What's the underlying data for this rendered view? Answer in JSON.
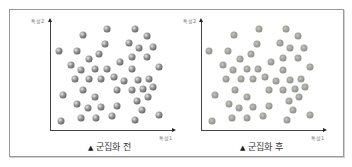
{
  "figure": {
    "panels": [
      {
        "id": "before",
        "caption_marker": "▲",
        "caption": "군집화 전",
        "y_label": "특성2",
        "x_label": "특성1",
        "dot_color": "#6e6e6e"
      },
      {
        "id": "after",
        "caption_marker": "▲",
        "caption": "군집화 후",
        "y_label": "특성2",
        "x_label": "특성1",
        "dot_color": "#9ea09a"
      }
    ],
    "points_before": [
      [
        83,
        35
      ],
      [
        107,
        29
      ],
      [
        135,
        29
      ],
      [
        147,
        36
      ],
      [
        59,
        51
      ],
      [
        77,
        51
      ],
      [
        105,
        44
      ],
      [
        129,
        43
      ],
      [
        139,
        48
      ],
      [
        153,
        47
      ],
      [
        89,
        59
      ],
      [
        99,
        54
      ],
      [
        120,
        62
      ],
      [
        132,
        57
      ],
      [
        147,
        57
      ],
      [
        71,
        65
      ],
      [
        81,
        70
      ],
      [
        95,
        69
      ],
      [
        107,
        69
      ],
      [
        132,
        69
      ],
      [
        159,
        67
      ],
      [
        75,
        79
      ],
      [
        89,
        79
      ],
      [
        101,
        79
      ],
      [
        114,
        77
      ],
      [
        124,
        81
      ],
      [
        138,
        80
      ],
      [
        149,
        79
      ],
      [
        63,
        95
      ],
      [
        83,
        90
      ],
      [
        117,
        90
      ],
      [
        132,
        90
      ],
      [
        143,
        89
      ],
      [
        153,
        87
      ],
      [
        95,
        97
      ],
      [
        137,
        101
      ],
      [
        148,
        97
      ],
      [
        77,
        104
      ],
      [
        88,
        108
      ],
      [
        101,
        107
      ],
      [
        117,
        106
      ],
      [
        142,
        110
      ],
      [
        61,
        121
      ],
      [
        81,
        118
      ],
      [
        96,
        118
      ],
      [
        112,
        116
      ],
      [
        135,
        120
      ],
      [
        159,
        115
      ]
    ],
    "points_after": [
      [
        234,
        35
      ],
      [
        259,
        29
      ],
      [
        286,
        29
      ],
      [
        298,
        36
      ],
      [
        209,
        51
      ],
      [
        228,
        51
      ],
      [
        257,
        44
      ],
      [
        280,
        43
      ],
      [
        290,
        48
      ],
      [
        304,
        48
      ],
      [
        240,
        59
      ],
      [
        251,
        54
      ],
      [
        271,
        62
      ],
      [
        283,
        58
      ],
      [
        298,
        58
      ],
      [
        223,
        65
      ],
      [
        233,
        70
      ],
      [
        247,
        69
      ],
      [
        258,
        69
      ],
      [
        283,
        70
      ],
      [
        310,
        67
      ],
      [
        226,
        79
      ],
      [
        241,
        79
      ],
      [
        253,
        79
      ],
      [
        265,
        77
      ],
      [
        276,
        81
      ],
      [
        290,
        80
      ],
      [
        301,
        79
      ],
      [
        215,
        95
      ],
      [
        235,
        90
      ],
      [
        269,
        90
      ],
      [
        283,
        90
      ],
      [
        295,
        89
      ],
      [
        305,
        87
      ],
      [
        247,
        97
      ],
      [
        289,
        101
      ],
      [
        299,
        97
      ],
      [
        229,
        104
      ],
      [
        239,
        108
      ],
      [
        253,
        107
      ],
      [
        269,
        106
      ],
      [
        293,
        110
      ],
      [
        212,
        121
      ],
      [
        232,
        118
      ],
      [
        247,
        118
      ],
      [
        263,
        116
      ],
      [
        287,
        120
      ],
      [
        310,
        115
      ]
    ]
  }
}
